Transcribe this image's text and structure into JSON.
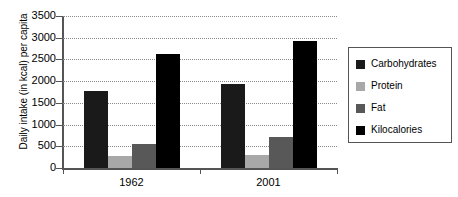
{
  "chart_data": {
    "type": "bar",
    "title": "",
    "xlabel": "",
    "ylabel": "Daily intake (in kcal) per capita",
    "categories": [
      "1962",
      "2001"
    ],
    "ylim": [
      0,
      3500
    ],
    "yticks": [
      0,
      500,
      1000,
      1500,
      2000,
      2500,
      3000,
      3500
    ],
    "ytick_labels": [
      "0",
      "500",
      "1000",
      "1500",
      "2000",
      "2500",
      "3000",
      "3500"
    ],
    "grid": true,
    "legend_position": "right",
    "series": [
      {
        "name": "Carbohydrates",
        "color": "#1a1a1a",
        "values": [
          1780,
          1940
        ]
      },
      {
        "name": "Protein",
        "color": "#a8a8a8",
        "values": [
          280,
          290
        ]
      },
      {
        "name": "Fat",
        "color": "#585858",
        "values": [
          550,
          710
        ]
      },
      {
        "name": "Kilocalories",
        "color": "#000000",
        "values": [
          2620,
          2930
        ]
      }
    ]
  },
  "axis": {
    "line_color": "#555555",
    "grid_color": "#8a8a8a"
  },
  "legend": {
    "entries": [
      {
        "label": "Carbohydrates",
        "color": "#1a1a1a"
      },
      {
        "label": "Protein",
        "color": "#a8a8a8"
      },
      {
        "label": "Fat",
        "color": "#585858"
      },
      {
        "label": "Kilocalories",
        "color": "#000000"
      }
    ]
  }
}
